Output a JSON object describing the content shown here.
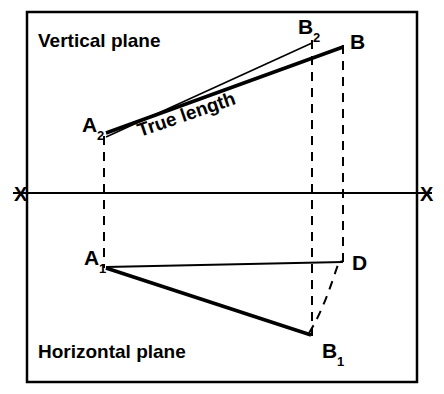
{
  "figure": {
    "title_vertical_plane": "Vertical plane",
    "title_horizontal_plane": "Horizontal  plane",
    "true_length_label": "True length",
    "axis_label_left": "X",
    "axis_label_right": "X",
    "points": {
      "A2": "A",
      "A2_sub": "2",
      "B2": "B",
      "B2_sub": "2",
      "B": "B",
      "A1": "A",
      "A1_sub": "1",
      "B1": "B",
      "B1_sub": "1",
      "D": "D"
    },
    "colors": {
      "ink": "#000000",
      "background": "#ffffff"
    }
  }
}
